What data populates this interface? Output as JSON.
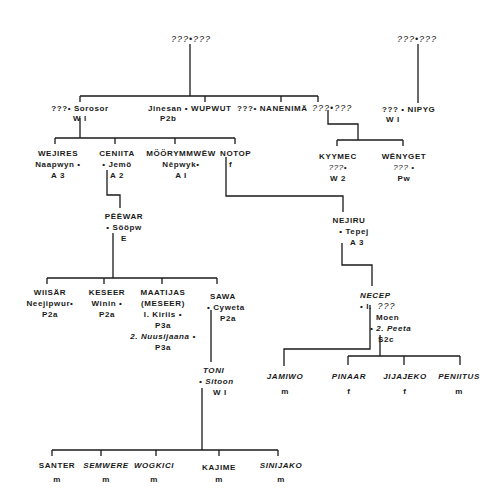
{
  "diagram": {
    "type": "genealogy",
    "unknown_marker": "???",
    "nodes": {
      "root_left": {
        "text": "???•???"
      },
      "root_right": {
        "text": "???•???"
      },
      "sorosor": {
        "line1": "???• Sorosor",
        "line2": "W I"
      },
      "wupwut": {
        "line1": "Jinesan • WUPWUT",
        "line2": "P2b"
      },
      "nanenima": {
        "line1": "???• NANENIMÄ"
      },
      "unknown_pair": {
        "line1": "???•???"
      },
      "nipyg": {
        "line1": "??? • NIPYG",
        "line2": "W I"
      },
      "wejires": {
        "line1": "WEJIRES",
        "line2": "Naapwyn •",
        "line3": "A 3"
      },
      "ceniita": {
        "line1": "CENIITA",
        "line2": "• Jemö",
        "line3": "A 2"
      },
      "moorymmwew": {
        "line1": "MÖÖRYMMWĒW",
        "line2": "Nēpwyk•",
        "line3": "A I"
      },
      "notop": {
        "line1": "NOTOP",
        "line2": "f"
      },
      "kyymec": {
        "line1": "KYYMEC",
        "line2": "???•",
        "line3": "W 2"
      },
      "wenyget": {
        "line1": "WĒNYGET",
        "line2": "??? •",
        "line3": "Pw"
      },
      "peewar": {
        "line1": "PĒĒWAR",
        "line2": "• Sööpw",
        "line3": "E"
      },
      "nejiru": {
        "line1": "NEJIRU",
        "line2": "• Tepej",
        "line3": "A 3"
      },
      "wiisar": {
        "line1": "WIISÄR",
        "line2": "Neejipwur•",
        "line3": "P2a"
      },
      "keseer": {
        "line1": "KESEER",
        "line2": "Winin •",
        "line3": "P2a"
      },
      "maatijas": {
        "line1": "MAATIJAS",
        "line2": "(MESEER)",
        "line3": "I. Kiriis •",
        "line4": "P3a",
        "line5": "2. Nuusijaana •",
        "line6": "P3a"
      },
      "sawa": {
        "line1": "SAWA",
        "line2": "• Cyweta",
        "line3": "P2a"
      },
      "necep": {
        "line1": "NECEP",
        "line2": "• I.",
        "line2b": "???",
        "line3": "Moen",
        "line4": "• 2. Peeta",
        "line5": "S2c"
      },
      "toni": {
        "line1": "TONI",
        "line2": "• Sitoon",
        "line3": "W I"
      },
      "jamiwo": {
        "line1": "JAMIWO",
        "line2": "m"
      },
      "pinaar": {
        "line1": "PINAAR",
        "line2": "f"
      },
      "jijajeko": {
        "line1": "JIJAJEKO",
        "line2": "f"
      },
      "peniitus": {
        "line1": "PENIITUS",
        "line2": "m"
      },
      "santer": {
        "line1": "SANTER",
        "line2": "m"
      },
      "semwere": {
        "line1": "SEMWERE",
        "line2": "m"
      },
      "wogkici": {
        "line1": "WOGKICI",
        "line2": "m"
      },
      "kajime": {
        "line1": "KAJIME",
        "line2": "m"
      },
      "sinijako": {
        "line1": "SINIJAKO",
        "line2": "m"
      }
    }
  }
}
